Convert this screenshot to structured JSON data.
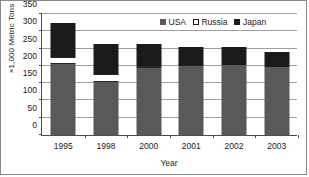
{
  "chart_data": {
    "type": "bar",
    "subtype": "stacked-vertical",
    "title": "",
    "xlabel": "Year",
    "ylabel": "×1,000 Metric Tons",
    "categories": [
      "1995",
      "1998",
      "2000",
      "2001",
      "2002",
      "2003"
    ],
    "series": [
      {
        "name": "USA",
        "color": "#595959",
        "values": [
          203,
          152,
          192,
          198,
          200,
          196
        ]
      },
      {
        "name": "Russia",
        "color": "#ffffff",
        "values": [
          22,
          23,
          5,
          3,
          0,
          0
        ]
      },
      {
        "name": "Japan",
        "color": "#1a1a1a",
        "values": [
          97,
          85,
          63,
          52,
          52,
          43
        ]
      }
    ],
    "totals": [
      322,
      260,
      260,
      253,
      252,
      239
    ],
    "ylim": [
      0,
      350
    ],
    "ytick_values": [
      0,
      50,
      100,
      150,
      200,
      250,
      300,
      350
    ],
    "ytick_labels": [
      "0",
      "50",
      "100",
      "150",
      "200",
      "250",
      "300",
      "350"
    ],
    "grid": "horizontal",
    "legend_position": "top-right",
    "legend_entries": [
      "USA",
      "Russia",
      "Japan"
    ]
  },
  "legend": {
    "items": [
      {
        "label": "USA",
        "swatch": "usa-legend-swatch"
      },
      {
        "label": "Russia",
        "swatch": "russia-legend-swatch"
      },
      {
        "label": "Japan",
        "swatch": "japan-legend-swatch"
      }
    ]
  },
  "axes": {
    "y_title": "×1,000 Metric Tons",
    "x_title": "Year"
  },
  "colors": {
    "usa": "#595959",
    "russia": "#ffffff",
    "japan": "#1a1a1a",
    "axis": "#4d4d4d",
    "grid": "#9e9e9e",
    "frame": "#8a8a8a",
    "text": "#1a1a1a"
  }
}
